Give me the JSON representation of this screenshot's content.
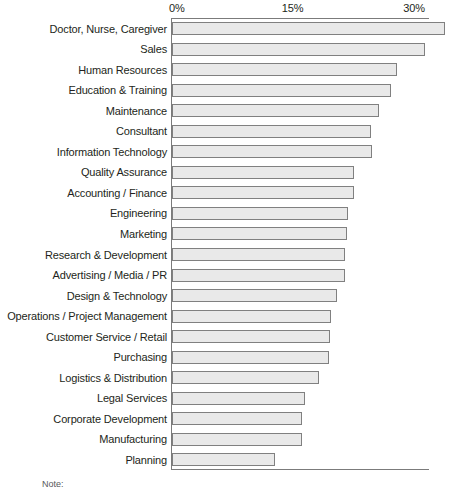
{
  "chart_data": {
    "type": "bar",
    "orientation": "horizontal",
    "title": "",
    "subtitle": "",
    "xlabel": "",
    "ylabel": "",
    "xlim": [
      0,
      35.2
    ],
    "grid": false,
    "legend": null,
    "xticks": [
      "0%",
      "15%",
      "30%"
    ],
    "xtick_values": [
      0,
      15,
      30
    ],
    "categories": [
      "Doctor, Nurse, Caregiver",
      "Sales",
      "Human Resources",
      "Education & Training",
      "Maintenance",
      "Consultant",
      "Information Technology",
      "Quality Assurance",
      "Accounting / Finance",
      "Engineering",
      "Marketing",
      "Research & Development",
      "Advertising / Media / PR",
      "Design & Technology",
      "Operations / Project Management",
      "Customer Service / Retail",
      "Purchasing",
      "Logistics & Distribution",
      "Legal Services",
      "Corporate Development",
      "Manufacturing",
      "Planning"
    ],
    "values": [
      33.7,
      31.2,
      27.8,
      27.0,
      25.6,
      24.6,
      24.7,
      22.5,
      22.5,
      21.7,
      21.6,
      21.4,
      21.4,
      20.4,
      19.6,
      19.5,
      19.4,
      18.1,
      16.4,
      16.0,
      16.0,
      12.7
    ],
    "bar_fill_color": "#e9e9e9",
    "bar_border_color": "#808080",
    "axis_color": "#7b7b7b",
    "text_color": "#231f20"
  },
  "footnote": {
    "label": "Note:"
  }
}
